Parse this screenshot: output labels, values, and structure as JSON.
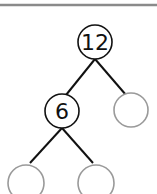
{
  "diagram": {
    "type": "number-bond-tree",
    "nodes": [
      {
        "id": "root",
        "value": "12",
        "cx": 95,
        "cy": 42,
        "r": 17,
        "stroke": "#111111"
      },
      {
        "id": "left",
        "value": "6",
        "cx": 62,
        "cy": 111,
        "r": 17,
        "stroke": "#111111"
      },
      {
        "id": "right",
        "value": "",
        "cx": 131,
        "cy": 110,
        "r": 17,
        "stroke": "#9a9a9a"
      },
      {
        "id": "left-left",
        "value": "",
        "cx": 26,
        "cy": 183,
        "r": 18,
        "stroke": "#9a9a9a"
      },
      {
        "id": "left-right",
        "value": "",
        "cx": 96,
        "cy": 183,
        "r": 18,
        "stroke": "#9a9a9a"
      }
    ],
    "colors": {
      "top_rule": "#8a8a8a",
      "edge": "#111111",
      "filled_node": "#111111",
      "empty_node": "#9a9a9a"
    }
  }
}
